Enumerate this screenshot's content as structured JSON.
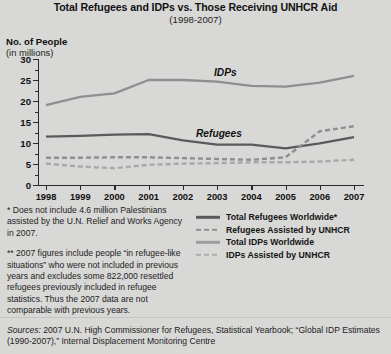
{
  "chart_data": {
    "type": "line",
    "title": "Total Refugees and IDPs vs. Those Receiving UNHCR Aid",
    "subtitle": "(1998-2007)",
    "ylabel_line1": "No. of People",
    "ylabel_line2": "(in millions)",
    "xlabel": "",
    "grid": false,
    "legend_position": "bottom-right",
    "ylim": [
      0,
      30
    ],
    "yticks": [
      0,
      5,
      10,
      15,
      20,
      25,
      30
    ],
    "categories": [
      "1998",
      "1999",
      "2000",
      "2001",
      "2002",
      "2003",
      "2004",
      "2005",
      "2006",
      "2007"
    ],
    "x": [
      1998,
      1999,
      2000,
      2001,
      2002,
      2003,
      2004,
      2005,
      2006,
      2007
    ],
    "annotations": [
      {
        "text": "IDPs",
        "x": 2003,
        "y": 27
      },
      {
        "text": "Refugees",
        "x": 2002.6,
        "y": 14.5
      }
    ],
    "series": [
      {
        "name": "Total IDPs Worldwide",
        "style": "solid",
        "color": "#8f8f8f",
        "values": [
          19.0,
          21.0,
          21.8,
          25.0,
          25.0,
          24.6,
          23.6,
          23.4,
          24.4,
          26.0
        ]
      },
      {
        "name": "Total Refugees Worldwide*",
        "style": "solid",
        "color": "#5a5a5a",
        "values": [
          11.5,
          11.7,
          12.0,
          12.1,
          10.6,
          9.6,
          9.6,
          8.7,
          9.9,
          11.4
        ]
      },
      {
        "name": "Refugees Assisted by UNHCR",
        "style": "dashed",
        "color": "#8f8f8f",
        "values": [
          6.5,
          6.5,
          6.6,
          6.6,
          6.4,
          6.2,
          6.0,
          6.6,
          12.8,
          14.0
        ]
      },
      {
        "name": "IDPs Assisted by UNHCR",
        "style": "dashed",
        "color": "#a8a8a8",
        "values": [
          5.1,
          4.4,
          4.0,
          4.8,
          5.1,
          5.2,
          5.4,
          5.4,
          5.6,
          6.0
        ]
      }
    ]
  },
  "legend": {
    "items": [
      {
        "label": "Total Refugees Worldwide*",
        "color": "#5a5a5a",
        "style": "solid"
      },
      {
        "label": "Refugees Assisted by UNHCR",
        "color": "#8f8f8f",
        "style": "dashed"
      },
      {
        "label": "Total IDPs Worldwide",
        "color": "#9d9d9d",
        "style": "solid"
      },
      {
        "label": "IDPs Assisted by UNHCR",
        "color": "#adadad",
        "style": "dashed"
      }
    ]
  },
  "notes": [
    "* Does not include 4.6 million Palestinians assisted by the U.N. Relief and Works Agency in 2007.",
    "** 2007 figures include people “in refugee-like situations” who were not included in previous years and excludes some 822,000 resettled refugees previously included in refugee statistics.  Thus the 2007 data are not comparable with previous years."
  ],
  "sources": {
    "label": "Sources:",
    "text": " 2007 U.N. High Commissioner for Refugees, Statistical Yearbook; “Global IDP Estimates (1990-2007),” Internal Displacement Monitoring Centre"
  }
}
